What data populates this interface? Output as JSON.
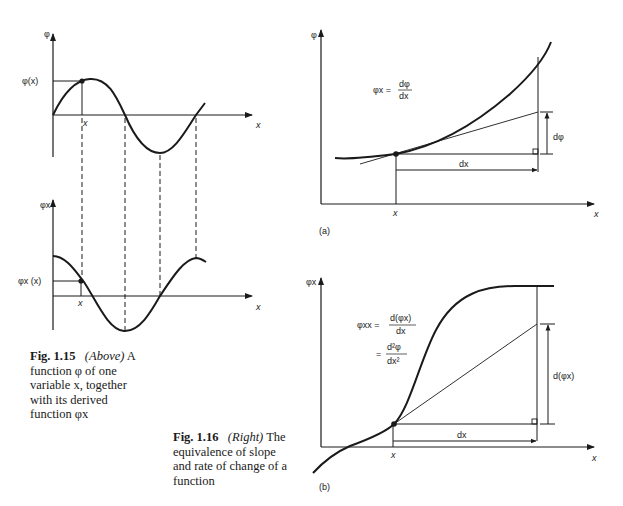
{
  "fig115": {
    "top_plot": {
      "y_axis_label": "φ",
      "x_axis_label": "x",
      "point_value_label": "φ(x)",
      "point_x_label": "x"
    },
    "bottom_plot": {
      "y_axis_label": "φx",
      "x_axis_label": "x",
      "point_value_label": "φx (x)",
      "point_x_label": "x"
    },
    "caption": {
      "number": "Fig. 1.15",
      "position": "(Above)",
      "line1_rest": "A",
      "line2": "function φ of one",
      "line3": "variable x, together",
      "line4": "with its derived",
      "line5": "function φx"
    }
  },
  "fig116": {
    "panel_a": {
      "y_axis_label": "φ",
      "x_axis_label": "x",
      "point_x_label": "x",
      "formula_lhs": "φx =",
      "formula_num": "dφ",
      "formula_den": "dx",
      "rise_label": "dφ",
      "run_label": "dx",
      "panel_label": "(a)"
    },
    "panel_b": {
      "y_axis_label": "φx",
      "x_axis_label": "x",
      "point_x_label": "x",
      "formula1_lhs": "φxx =",
      "formula1_num": "d(φx)",
      "formula1_den": "dx",
      "formula2_lhs": "=",
      "formula2_num": "d²φ",
      "formula2_den": "dx²",
      "rise_label": "d(φx)",
      "run_label": "dx",
      "panel_label": "(b)"
    },
    "caption": {
      "number": "Fig. 1.16",
      "position": "(Right)",
      "line1_rest": "The",
      "line2": "equivalence of slope",
      "line3": "and rate of change of a",
      "line4": "function"
    }
  },
  "colors": {
    "ink": "#1a1a1a",
    "background": "#ffffff"
  }
}
